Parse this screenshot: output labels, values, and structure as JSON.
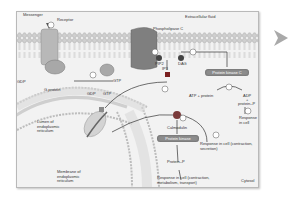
{
  "diagram": {
    "regions": {
      "extracellular": "Extracellular fluid",
      "cytosol": "Cytosol",
      "er_lumen": "Lumen of endoplasmic reticulum",
      "er_membrane": "Membrane of endoplasmic reticulum"
    },
    "labels": {
      "messenger": "Messenger",
      "receptor": "Receptor",
      "phospholipase_c": "Phospholipase C",
      "pip2": "PIP2",
      "dag": "DAG",
      "ip3": "IP3",
      "gdp_left": "GDP",
      "g_protein": "G protein",
      "gdp_mid": "GDP",
      "gtp_mid": "GTP",
      "gtp_right": "GTP",
      "protein_kinase_c": "Protein kinase C",
      "atp_protein": "ATP + protein",
      "adp": "ADP",
      "plus": "+",
      "protein_p_right": "protein–P",
      "response_right": "Response in cell",
      "calmodulin": "Calmodulin",
      "protein_kinase": "Protein kinase",
      "protein_p": "Protein–P",
      "response_contraction_secretion": "Response in cell (contraction, secretion)",
      "response_bottom": "Response in cell (contraction, metabolism, transport)"
    },
    "steps": [
      "1",
      "2",
      "3",
      "4",
      "5",
      "6",
      "7",
      "8",
      "9"
    ],
    "colors": {
      "frame_bg": "#f2f2f2",
      "membrane_head": "#c8c8c8",
      "protein": "#9a9a9a",
      "kinase": "#8c8c8c"
    }
  },
  "navigation": {
    "next_icon": "chevron-right-icon"
  }
}
